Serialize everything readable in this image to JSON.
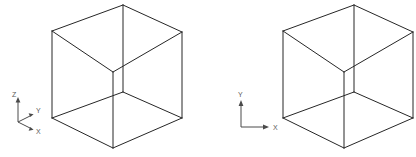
{
  "figure": {
    "width": 416,
    "height": 157,
    "background_color": "#ffffff",
    "line_color": "#262626",
    "axis_color": "#4a4a4a",
    "label_color": "#5a5a5a"
  },
  "objects": [
    {
      "name": "left-cube",
      "type": "wireframe-cube-isometric",
      "vertices": {
        "top_apex": [
          123,
          5
        ],
        "top_left": [
          52,
          31
        ],
        "top_right": [
          182,
          32
        ],
        "top_center": [
          113,
          72
        ],
        "bottom_left": [
          52,
          118
        ],
        "bottom_right": [
          182,
          118
        ],
        "bottom_apex": [
          113,
          148
        ],
        "bottom_center": [
          123,
          92
        ]
      }
    },
    {
      "name": "right-cube",
      "type": "wireframe-cube-isometric",
      "vertices": {
        "top_apex": [
          354,
          5
        ],
        "top_left": [
          283,
          31
        ],
        "top_right": [
          413,
          32
        ],
        "top_center": [
          344,
          72
        ],
        "bottom_left": [
          283,
          118
        ],
        "bottom_right": [
          413,
          118
        ],
        "bottom_apex": [
          344,
          148
        ],
        "bottom_center": [
          354,
          92
        ]
      }
    }
  ],
  "axes": {
    "left_triad": {
      "name": "3d-axis-triad",
      "type": "3d",
      "origin": [
        18,
        122
      ],
      "labels": {
        "z": "Z",
        "y": "Y",
        "x": "X"
      },
      "directions": {
        "z": "up",
        "y": "upper-right",
        "x": "lower-right"
      }
    },
    "right_triad": {
      "name": "2d-axis-triad",
      "type": "2d",
      "origin": [
        241,
        127
      ],
      "labels": {
        "y": "Y",
        "x": "X"
      },
      "directions": {
        "y": "up",
        "x": "right"
      }
    }
  }
}
